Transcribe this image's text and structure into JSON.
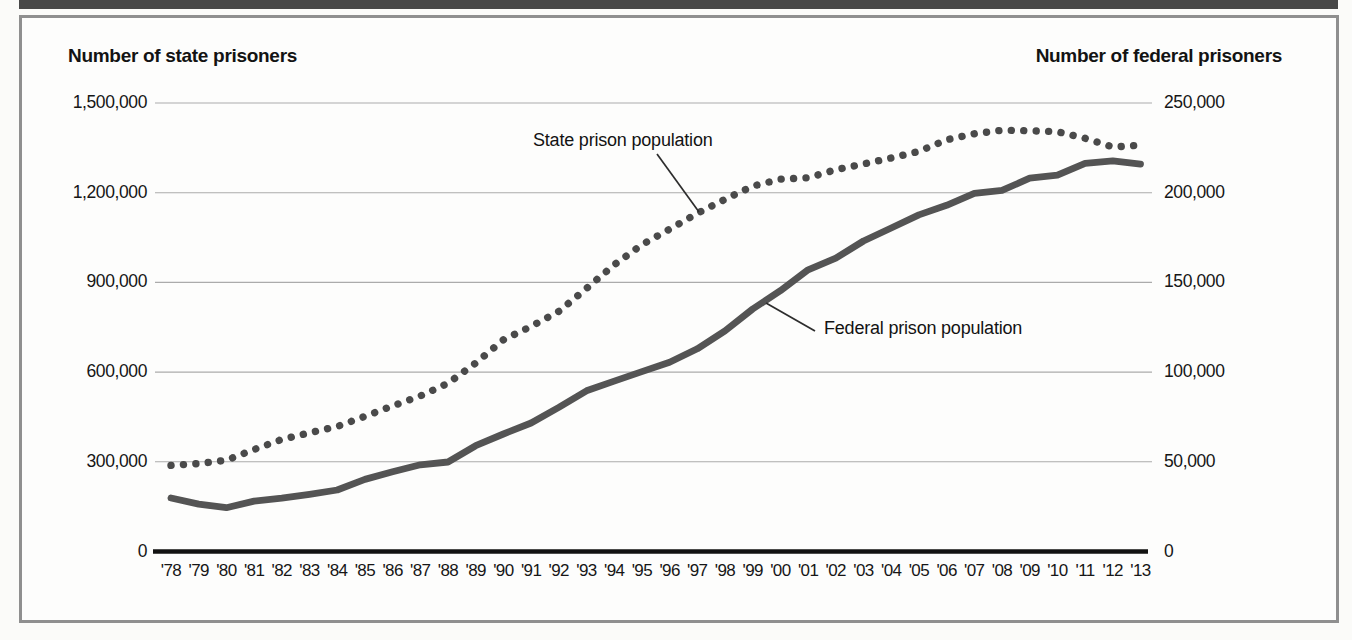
{
  "titles": {
    "left": "Number of state prisoners",
    "right": "Number of federal prisoners"
  },
  "annotations": {
    "state_label": "State prison population",
    "federal_label": "Federal prison population"
  },
  "colors": {
    "state_line": "#4a4a4a",
    "federal_line": "#545454",
    "top_bar": "#484848",
    "frame_border": "#8f8f8f"
  },
  "chart_data": {
    "type": "line",
    "title": "",
    "grid": true,
    "legend_position": "inline-annotations",
    "years": [
      1978,
      1979,
      1980,
      1981,
      1982,
      1983,
      1984,
      1985,
      1986,
      1987,
      1988,
      1989,
      1990,
      1991,
      1992,
      1993,
      1994,
      1995,
      1996,
      1997,
      1998,
      1999,
      2000,
      2001,
      2002,
      2003,
      2004,
      2005,
      2006,
      2007,
      2008,
      2009,
      2010,
      2011,
      2012,
      2013
    ],
    "x_tick_labels": [
      "'78",
      "'79",
      "'80",
      "'81",
      "'82",
      "'83",
      "'84",
      "'85",
      "'86",
      "'87",
      "'88",
      "'89",
      "'90",
      "'91",
      "'92",
      "'93",
      "'94",
      "'95",
      "'96",
      "'97",
      "'98",
      "'99",
      "'00",
      "'01",
      "'02",
      "'03",
      "'04",
      "'05",
      "'06",
      "'07",
      "'08",
      "'09",
      "'10",
      "'11",
      "'12",
      "'13"
    ],
    "left_axis": {
      "title": "Number of state prisoners",
      "ticks": [
        "1,500,000",
        "1,200,000",
        "900,000",
        "600,000",
        "300,000",
        "0"
      ],
      "range": [
        0,
        1500000
      ]
    },
    "right_axis": {
      "title": "Number of federal prisoners",
      "ticks": [
        "250,000",
        "200,000",
        "150,000",
        "100,000",
        "50,000",
        "0"
      ],
      "range": [
        0,
        250000
      ]
    },
    "series": [
      {
        "name": "State prison population",
        "axis": "left",
        "line_style": "dotted",
        "color": "#4a4a4a",
        "values": [
          288000,
          294000,
          305500,
          341000,
          375000,
          397000,
          418000,
          452000,
          487000,
          520000,
          563000,
          630000,
          708000,
          753000,
          803000,
          880000,
          959000,
          1026000,
          1078000,
          1131000,
          1178000,
          1222000,
          1245000,
          1250000,
          1277000,
          1296000,
          1316000,
          1338000,
          1377000,
          1397000,
          1409000,
          1407000,
          1404000,
          1382000,
          1353000,
          1359000
        ]
      },
      {
        "name": "Federal prison population",
        "axis": "right",
        "line_style": "solid",
        "color": "#545454",
        "values": [
          29800,
          26400,
          24400,
          28100,
          29700,
          31900,
          34300,
          40200,
          44400,
          48300,
          49900,
          59000,
          65500,
          71600,
          80300,
          89600,
          95000,
          100300,
          105500,
          113000,
          123000,
          135200,
          145400,
          157000,
          163500,
          173100,
          180300,
          187600,
          193000,
          199600,
          201300,
          208100,
          209800,
          216400,
          217800,
          215900
        ]
      }
    ]
  }
}
